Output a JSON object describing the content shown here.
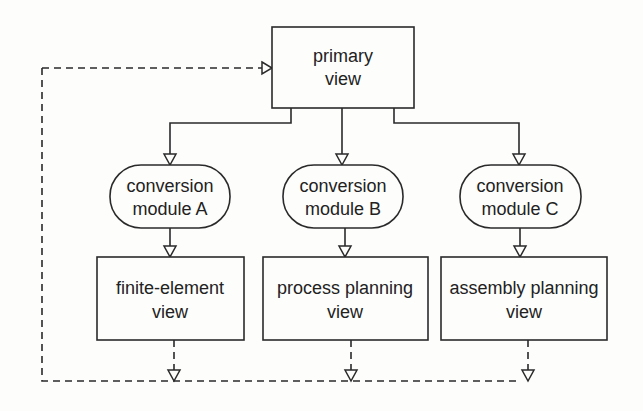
{
  "diagram": {
    "type": "flowchart",
    "primary": {
      "line1": "primary",
      "line2": "view"
    },
    "modules": [
      {
        "line1": "conversion",
        "line2": "module A"
      },
      {
        "line1": "conversion",
        "line2": "module B"
      },
      {
        "line1": "conversion",
        "line2": "module C"
      }
    ],
    "views": [
      {
        "line1": "finite-element",
        "line2": "view"
      },
      {
        "line1": "process planning",
        "line2": "view"
      },
      {
        "line1": "assembly planning",
        "line2": "view"
      }
    ],
    "edges": [
      {
        "from": "primary view",
        "to": "conversion module A",
        "style": "solid"
      },
      {
        "from": "primary view",
        "to": "conversion module B",
        "style": "solid"
      },
      {
        "from": "primary view",
        "to": "conversion module C",
        "style": "solid"
      },
      {
        "from": "conversion module A",
        "to": "finite-element view",
        "style": "solid"
      },
      {
        "from": "conversion module B",
        "to": "process planning view",
        "style": "solid"
      },
      {
        "from": "conversion module C",
        "to": "assembly planning view",
        "style": "solid"
      },
      {
        "from": "finite-element view",
        "to": "primary view",
        "style": "dashed"
      },
      {
        "from": "process planning view",
        "to": "primary view",
        "style": "dashed"
      },
      {
        "from": "assembly planning view",
        "to": "primary view",
        "style": "dashed"
      }
    ],
    "colors": {
      "stroke": "#2a2a2a",
      "background": "#fdfdfc",
      "text": "#222222"
    }
  }
}
